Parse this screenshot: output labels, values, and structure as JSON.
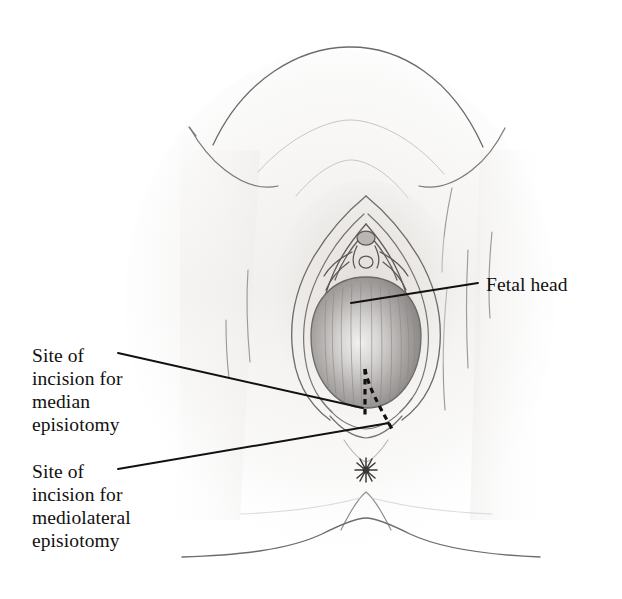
{
  "figure": {
    "type": "medical-illustration",
    "background_color": "#ffffff",
    "ink_color": "#111111",
    "skin_tone": "#f7f6f5",
    "shading_color": "#8d8d8d",
    "width": 622,
    "height": 599
  },
  "annotations": {
    "fetal_head": {
      "label": "Fetal head",
      "leader_from": [
        478,
        283
      ],
      "leader_to": [
        351,
        303
      ]
    },
    "median_episiotomy": {
      "label": "Site of\nincision for\nmedian\nepisiotomy",
      "leader_from": [
        118,
        353
      ],
      "leader_to": [
        363,
        408
      ]
    },
    "mediolateral_episiotomy": {
      "label": "Site of\nincision for\nmediolateral\nepisiotomy",
      "leader_from": [
        118,
        469
      ],
      "leader_to": [
        389,
        423
      ]
    }
  },
  "anatomy": {
    "parts": [
      "mons-pubis",
      "labia-majora",
      "labia-minora",
      "clitoral-hood",
      "vaginal-introitus",
      "fetal-head",
      "perineum",
      "anus",
      "inner-thigh-crease-left",
      "inner-thigh-crease-right",
      "gluteal-fold"
    ]
  },
  "incision_lines": {
    "median": {
      "name": "median episiotomy incision",
      "style": "dashed",
      "color": "#111111",
      "start": [
        365,
        370
      ],
      "end": [
        365,
        418
      ]
    },
    "mediolateral": {
      "name": "mediolateral episiotomy incision",
      "style": "dashed",
      "color": "#111111",
      "start": [
        365,
        370
      ],
      "end": [
        392,
        429
      ]
    }
  }
}
